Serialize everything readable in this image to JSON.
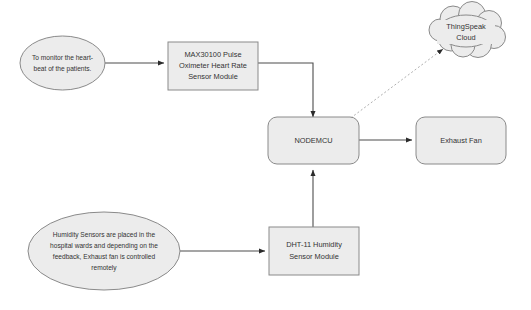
{
  "diagram": {
    "colors": {
      "node_fill": "#ececec",
      "node_stroke": "#8a8a8a",
      "connector": "#4d4d4d",
      "connector_dotted": "#b0b0b0",
      "text": "#333333",
      "background": "#ffffff"
    },
    "nodes": {
      "heartbeat_note": {
        "shape": "ellipse",
        "lines": [
          "To monitor the heart-",
          "beat of the patients."
        ]
      },
      "max30100": {
        "shape": "rectangle",
        "lines": [
          "MAX30100 Pulse",
          "Oximeter Heart Rate",
          "Sensor Module"
        ]
      },
      "nodemcu": {
        "shape": "rounded-rectangle",
        "lines": [
          "NODEMCU"
        ]
      },
      "thingspeak_cloud": {
        "shape": "cloud",
        "lines": [
          "ThingSpeak",
          "Cloud"
        ]
      },
      "exhaust_fan": {
        "shape": "rounded-rectangle",
        "lines": [
          "Exhaust Fan"
        ]
      },
      "humidity_note": {
        "shape": "ellipse",
        "lines": [
          "Humidity Sensors are placed in the",
          "hospital wards and depending on the",
          "feedback, Exhaust fan is controlled",
          "remotely"
        ]
      },
      "dht11": {
        "shape": "rectangle",
        "lines": [
          "DHT-11 Humidity",
          "Sensor Module"
        ]
      }
    },
    "edges": [
      {
        "id": "heartbeat-to-max30100",
        "from": "heartbeat_note",
        "to": "max30100",
        "style": "solid",
        "arrow": true
      },
      {
        "id": "max30100-to-nodemcu",
        "from": "max30100",
        "to": "nodemcu",
        "style": "solid",
        "arrow": true
      },
      {
        "id": "nodemcu-to-cloud",
        "from": "nodemcu",
        "to": "thingspeak_cloud",
        "style": "dotted",
        "arrow": true
      },
      {
        "id": "nodemcu-to-exhaust-fan",
        "from": "nodemcu",
        "to": "exhaust_fan",
        "style": "solid",
        "arrow": true
      },
      {
        "id": "humidity-to-dht11",
        "from": "humidity_note",
        "to": "dht11",
        "style": "solid",
        "arrow": true
      },
      {
        "id": "dht11-to-nodemcu",
        "from": "dht11",
        "to": "nodemcu",
        "style": "solid",
        "arrow": true
      }
    ]
  }
}
